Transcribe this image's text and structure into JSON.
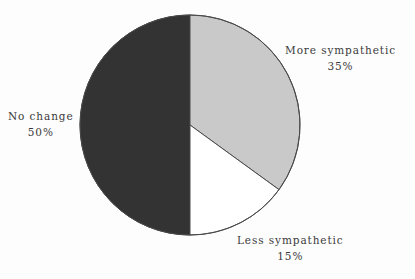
{
  "chart_data": {
    "type": "pie",
    "title": "",
    "subtitle": "",
    "xlabel": "",
    "ylabel": "",
    "legend_position": "none",
    "grid": false,
    "unit": "%",
    "start_angle_deg": 0,
    "direction": "clockwise",
    "categories": [
      "More sympathetic",
      "Less sympathetic",
      "No change"
    ],
    "values": [
      35,
      15,
      50
    ],
    "slices": [
      {
        "label": "More sympathetic",
        "value": 35,
        "value_text": "35%",
        "color": "#c9c9c9",
        "start_deg": 0,
        "end_deg": 126
      },
      {
        "label": "Less sympathetic",
        "value": 15,
        "value_text": "15%",
        "color": "#ffffff",
        "start_deg": 126,
        "end_deg": 180
      },
      {
        "label": "No change",
        "value": 50,
        "value_text": "50%",
        "color": "#333333",
        "start_deg": 180,
        "end_deg": 360
      }
    ]
  },
  "labels": {
    "more": {
      "name": "More sympathetic",
      "value": "35%"
    },
    "less": {
      "name": "Less sympathetic",
      "value": "15%"
    },
    "nochange": {
      "name": "No change",
      "value": "50%"
    }
  },
  "colors": {
    "background": "#fdfdfd",
    "slice_more": "#c9c9c9",
    "slice_less": "#ffffff",
    "slice_nochange": "#333333",
    "outline": "#4a4a4a",
    "text": "#3a3a3a"
  }
}
